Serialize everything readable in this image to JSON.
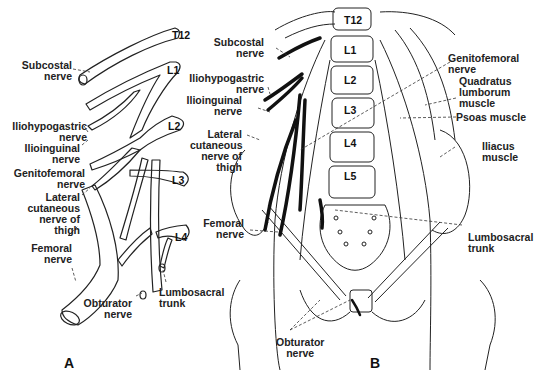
{
  "figure": {
    "panel_a": {
      "letter": "A",
      "roots": [
        "T12",
        "L1",
        "L2",
        "L3",
        "L4"
      ],
      "labels": {
        "subcostal": "Subcostal\nnerve",
        "iliohypogastric": "Iliohypogastric\nnerve",
        "ilioinguinal": "Ilioinguinal\nnerve",
        "genitofemoral": "Genitofemoral\nnerve",
        "lateral_cutaneous": "Lateral\ncutaneous\nnerve of\nthigh",
        "femoral": "Femoral\nnerve",
        "obturator": "Obturator\nnerve",
        "lumbosacral": "Lumbosacral\ntrunk"
      }
    },
    "panel_b": {
      "letter": "B",
      "vertebrae": [
        "T12",
        "L1",
        "L2",
        "L3",
        "L4",
        "L5"
      ],
      "labels": {
        "subcostal": "Subcostal\nnerve",
        "iliohypogastric": "Iliohypogastric\nnerve",
        "ilioinguinal": "Ilioinguinal\nnerve",
        "lateral_cutaneous": "Lateral\ncutaneous\nnerve of\nthigh",
        "femoral": "Femoral\nnerve",
        "obturator": "Obturator\nnerve",
        "genitofemoral": "Genitofemoral\nnerve",
        "quadratus": "Quadratus\nlumborum\nmuscle",
        "psoas": "Psoas muscle",
        "iliacus": "Iliacus\nmuscle",
        "lumbosacral": "Lumbosacral\ntrunk"
      }
    }
  }
}
